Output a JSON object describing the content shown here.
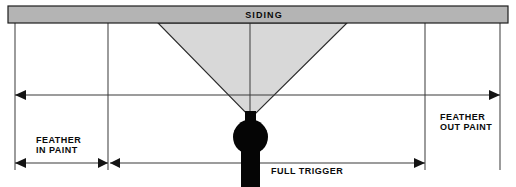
{
  "diagram": {
    "width": 516,
    "height": 187,
    "background_color": "#ffffff"
  },
  "siding": {
    "label": "SIDING",
    "fill_color": "#b4b4b4",
    "stroke_color": "#1d1d1d",
    "x": 8,
    "y": 6,
    "width": 500,
    "height": 17,
    "label_x": 264,
    "label_y": 18
  },
  "spray_cone": {
    "name": "spray-pattern-cone",
    "fill_color": "#d8d8d8",
    "stroke_color": "#2b2b2b",
    "points": "158,23 347,23 251,118"
  },
  "spray_gun": {
    "name": "spray-gun",
    "color": "#050505",
    "neck": {
      "x": 245,
      "y": 112,
      "width": 11,
      "height": 11
    },
    "body_circle": {
      "cx": 250.5,
      "cy": 137,
      "r": 17.5
    },
    "handle": {
      "x": 241,
      "y": 150,
      "width": 19,
      "height": 37
    }
  },
  "extension_lines": [
    {
      "name": "ext-line-left-edge",
      "x": 15,
      "y1": 23,
      "y2": 170
    },
    {
      "name": "ext-line-feather-in-end",
      "x": 108,
      "y1": 23,
      "y2": 170
    },
    {
      "name": "ext-line-center-nozzle",
      "x": 250,
      "y1": 23,
      "y2": 112
    },
    {
      "name": "ext-line-full-trigger-end",
      "x": 425,
      "y1": 23,
      "y2": 170
    },
    {
      "name": "ext-line-right-edge",
      "x": 500,
      "y1": 23,
      "y2": 170
    }
  ],
  "dimensions": {
    "upper": {
      "name": "total-coverage-dimension",
      "y": 95,
      "x_start": 15,
      "x_end": 500,
      "arrow_start": true,
      "arrow_end": true
    },
    "lower_left": {
      "name": "feather-in-dimension",
      "y": 163,
      "x_start": 15,
      "x_end": 108,
      "arrow_start": true,
      "arrow_end": true
    },
    "lower_right": {
      "name": "full-trigger-dimension",
      "y": 163,
      "x_start": 108,
      "x_end": 425,
      "arrow_start": true,
      "arrow_end": true
    }
  },
  "labels": {
    "feather_in": {
      "line1": "FEATHER",
      "line2": "IN PAINT",
      "x": 36,
      "y1": 143,
      "y2": 153
    },
    "feather_out": {
      "line1": "FEATHER",
      "line2": "OUT PAINT",
      "x": 440,
      "y1": 120,
      "y2": 130
    },
    "full_trigger": {
      "text": "FULL TRIGGER",
      "x": 271,
      "y": 174
    }
  }
}
